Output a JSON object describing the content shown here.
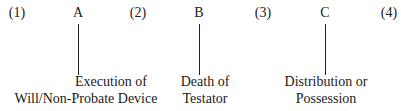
{
  "timeline": {
    "periods": [
      {
        "label": "(1)",
        "x": 17
      },
      {
        "label": "(2)",
        "x": 138
      },
      {
        "label": "(3)",
        "x": 263
      },
      {
        "label": "(4)",
        "x": 389
      }
    ],
    "events": [
      {
        "marker": "A",
        "x": 78,
        "caption_lines": [
          "Execution of",
          "Will/Non-Probate Device"
        ],
        "caption_x": 86
      },
      {
        "marker": "B",
        "x": 199,
        "caption_lines": [
          "Death of",
          "Testator"
        ],
        "caption_x": 205
      },
      {
        "marker": "C",
        "x": 325,
        "caption_lines": [
          "Distribution or",
          "Possession"
        ],
        "caption_x": 326
      }
    ]
  }
}
